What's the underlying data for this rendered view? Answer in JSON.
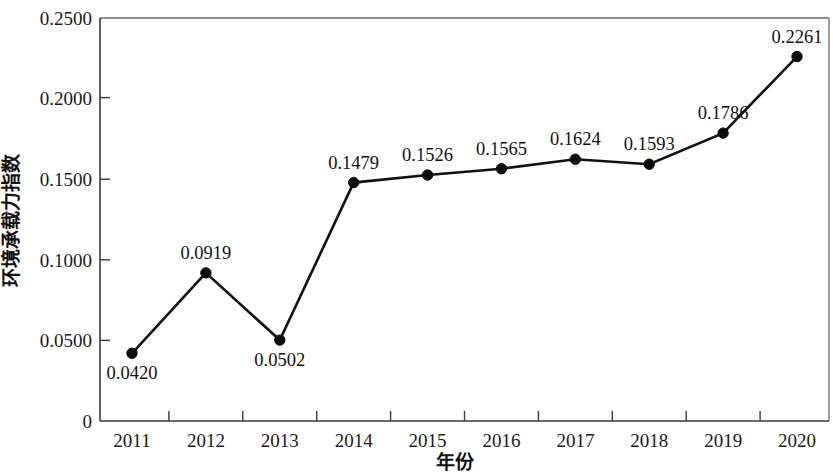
{
  "chart_data": {
    "type": "line",
    "title": "",
    "subtitle": "",
    "xlabel": "年份",
    "ylabel": "环境承载力指数",
    "categories": [
      "2011",
      "2012",
      "2013",
      "2014",
      "2015",
      "2016",
      "2017",
      "2018",
      "2019",
      "2020"
    ],
    "values": [
      0.042,
      0.0919,
      0.0502,
      0.1479,
      0.1526,
      0.1565,
      0.1624,
      0.1593,
      0.1786,
      0.2261
    ],
    "point_labels": [
      "0.0420",
      "0.0919",
      "0.0502",
      "0.1479",
      "0.1526",
      "0.1565",
      "0.1624",
      "0.1593",
      "0.1786",
      "0.2261"
    ],
    "label_positions": [
      "below",
      "above",
      "below",
      "above",
      "above",
      "above",
      "above",
      "above",
      "above",
      "above"
    ],
    "ylim": [
      0,
      0.25
    ],
    "ytick_values": [
      0,
      0.05,
      0.1,
      0.15,
      0.2,
      0.25
    ],
    "ytick_labels": [
      "0",
      "0.0500",
      "0.1000",
      "0.1500",
      "0.2000",
      "0.2500"
    ],
    "grid": false,
    "legend": null,
    "marker": "filled-circle",
    "line_color": "#111111",
    "marker_color": "#0d0d0d",
    "background_color": "#ffffff"
  },
  "axes": {
    "y_title": "环境承载力指数",
    "x_title": "年份"
  },
  "y_ticks": [
    {
      "label": "0.2500",
      "value": 0.25
    },
    {
      "label": "0.2000",
      "value": 0.2
    },
    {
      "label": "0.1500",
      "value": 0.15
    },
    {
      "label": "0.1000",
      "value": 0.1
    },
    {
      "label": "0.0500",
      "value": 0.05
    },
    {
      "label": "0",
      "value": 0
    }
  ],
  "x_ticks": [
    {
      "label": "2011"
    },
    {
      "label": "2012"
    },
    {
      "label": "2013"
    },
    {
      "label": "2014"
    },
    {
      "label": "2015"
    },
    {
      "label": "2016"
    },
    {
      "label": "2017"
    },
    {
      "label": "2018"
    },
    {
      "label": "2019"
    },
    {
      "label": "2020"
    }
  ],
  "points": [
    {
      "label": "0.0420"
    },
    {
      "label": "0.0919"
    },
    {
      "label": "0.0502"
    },
    {
      "label": "0.1479"
    },
    {
      "label": "0.1526"
    },
    {
      "label": "0.1565"
    },
    {
      "label": "0.1624"
    },
    {
      "label": "0.1593"
    },
    {
      "label": "0.1786"
    },
    {
      "label": "0.2261"
    }
  ]
}
